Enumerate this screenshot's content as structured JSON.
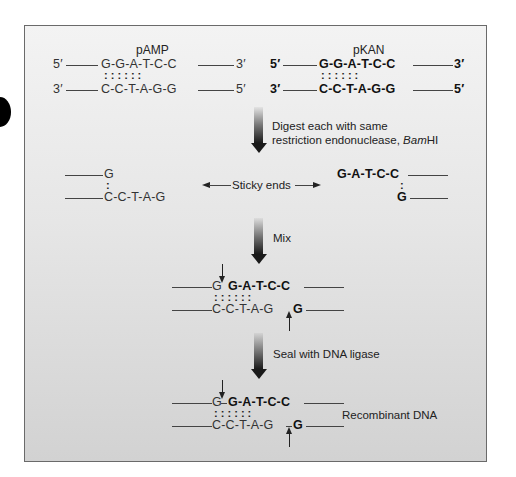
{
  "plasmids": {
    "pamp": {
      "label": "pAMP",
      "top_5": "5′",
      "top_3": "3′",
      "bottom_3": "3′",
      "bottom_5": "5′",
      "top_seq": "G-G-A-T-C-C",
      "bottom_seq": "C-C-T-A-G-G",
      "pairs": ":  :  :  :  :  :"
    },
    "pkan": {
      "label": "pKAN",
      "top_5": "5′",
      "top_3": "3′",
      "bottom_3": "3′",
      "bottom_5": "5′",
      "top_seq": "G-G-A-T-C-C",
      "bottom_seq": "C-C-T-A-G-G",
      "pairs": ":  :  :  :  :  :"
    }
  },
  "steps": {
    "digest": {
      "line1": "Digest each with same",
      "line2_prefix": "restriction endonuclease, ",
      "line2_italic": "Bam",
      "line2_suffix": "HI"
    },
    "mix": {
      "label": "Mix"
    },
    "seal": {
      "label": "Seal with DNA ligase"
    }
  },
  "sticky": {
    "label": "Sticky ends",
    "left_top": "G",
    "left_bottom": "C-C-T-A-G",
    "left_pair": ":",
    "right_top": "G-A-T-C-C",
    "right_bottom": "G",
    "right_pair": ":"
  },
  "mixed": {
    "top_plain": "G",
    "top_bold": "G-A-T-C-C",
    "bottom_plain": "C-C-T-A-G",
    "bottom_bold": "G",
    "pairs": ":  :  :  :  :  :"
  },
  "recombinant": {
    "top_plain": "G",
    "top_bold": "G-A-T-C-C",
    "bottom_plain": "C-C-T-A-G",
    "bottom_bold": "G",
    "pairs": ":  :  :  :  :  :",
    "label": "Recombinant DNA"
  }
}
